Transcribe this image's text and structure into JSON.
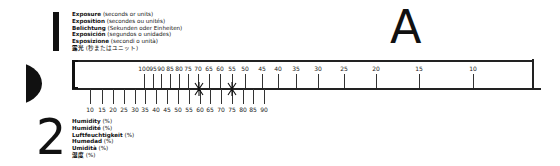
{
  "section1": {
    "number": "1",
    "legend": [
      {
        "bold": "Exposure",
        "note": " (seconds or units)"
      },
      {
        "bold": "Exposition",
        "note": " (secondes ou unités)"
      },
      {
        "bold": "Belichtung",
        "note": " (Sekunden oder Einheiten)"
      },
      {
        "bold": "Exposición",
        "note": " (segundos o unidades)"
      },
      {
        "bold": "Esposizione",
        "note": " (secondi o unità)"
      },
      {
        "bold": "露光",
        "note": " (秒またはユニット)"
      }
    ]
  },
  "section2": {
    "number": "2",
    "legend": [
      {
        "bold": "Humidity",
        "note": " (%)"
      },
      {
        "bold": "Humidité",
        "note": " (%)"
      },
      {
        "bold": "Luftfeuchtigkeit",
        "note": " (%)"
      },
      {
        "bold": "Humedad",
        "note": " (%)"
      },
      {
        "bold": "Umidità",
        "note": " (%)"
      },
      {
        "bold": "湿度",
        "note": " (%)"
      }
    ]
  },
  "scale_label": "A",
  "exposure_scale": [
    {
      "value": "100",
      "x": 144
    },
    {
      "value": "95",
      "x": 153
    },
    {
      "value": "90",
      "x": 161
    },
    {
      "value": "85",
      "x": 170
    },
    {
      "value": "80",
      "x": 179
    },
    {
      "value": "75",
      "x": 188
    },
    {
      "value": "70",
      "x": 198
    },
    {
      "value": "65",
      "x": 209
    },
    {
      "value": "60",
      "x": 220
    },
    {
      "value": "55",
      "x": 232
    },
    {
      "value": "50",
      "x": 245
    },
    {
      "value": "45",
      "x": 262
    },
    {
      "value": "40",
      "x": 278
    },
    {
      "value": "35",
      "x": 296
    },
    {
      "value": "30",
      "x": 318
    },
    {
      "value": "25",
      "x": 344
    },
    {
      "value": "20",
      "x": 376
    },
    {
      "value": "15",
      "x": 419
    },
    {
      "value": "10",
      "x": 473
    }
  ],
  "humidity_scale": [
    {
      "value": "10",
      "x": 90
    },
    {
      "value": "15",
      "x": 102
    },
    {
      "value": "20",
      "x": 113
    },
    {
      "value": "25",
      "x": 124
    },
    {
      "value": "30",
      "x": 135
    },
    {
      "value": "35",
      "x": 145
    },
    {
      "value": "40",
      "x": 156
    },
    {
      "value": "45",
      "x": 167
    },
    {
      "value": "50",
      "x": 178
    },
    {
      "value": "55",
      "x": 189
    },
    {
      "value": "60",
      "x": 200
    },
    {
      "value": "65",
      "x": 210
    },
    {
      "value": "70",
      "x": 221
    },
    {
      "value": "75",
      "x": 232
    },
    {
      "value": "80",
      "x": 243
    },
    {
      "value": "85",
      "x": 253
    },
    {
      "value": "90",
      "x": 264
    }
  ],
  "markers": [
    {
      "exposure": "70",
      "humidity": "60",
      "x": 199
    },
    {
      "exposure": "55",
      "humidity": "75",
      "x": 232
    }
  ]
}
